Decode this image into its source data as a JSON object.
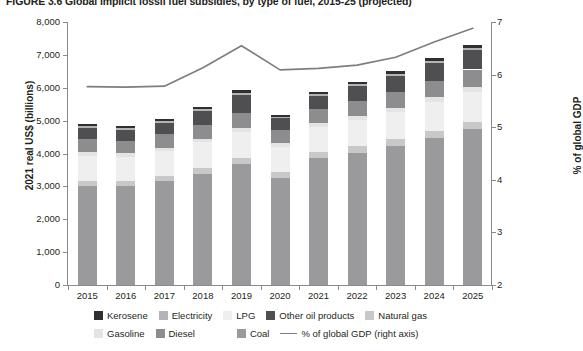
{
  "figure": {
    "title": "FIGURE 3.6  Global implicit fossil fuel subsidies, by type of fuel, 2015-25 (projected)"
  },
  "chart_data": {
    "type": "bar",
    "subtype": "stacked-bar-with-line",
    "title": "Global implicit fossil fuel subsidies, by type of fuel, 2015-25 (projected)",
    "xlabel": "",
    "ylabel": "2021 real US$ (billions)",
    "y2label": "% of global GDP",
    "ylim": [
      0,
      8000
    ],
    "y2lim": [
      2,
      7
    ],
    "yticks": [
      "0",
      "1,000",
      "2,000",
      "3,000",
      "4,000",
      "5,000",
      "6,000",
      "7,000",
      "8,000"
    ],
    "ytick_values": [
      0,
      1000,
      2000,
      3000,
      4000,
      5000,
      6000,
      7000,
      8000
    ],
    "y2ticks": [
      "2",
      "3",
      "4",
      "5",
      "6",
      "7"
    ],
    "y2tick_values": [
      2,
      3,
      4,
      5,
      6,
      7
    ],
    "grid": false,
    "legend_position": "bottom",
    "categories": [
      "2015",
      "2016",
      "2017",
      "2018",
      "2019",
      "2020",
      "2021",
      "2022",
      "2023",
      "2024",
      "2025"
    ],
    "series": [
      {
        "name": "Coal",
        "color": "#9a9a9c",
        "values": [
          3010,
          3010,
          3170,
          3390,
          3680,
          3260,
          3860,
          4030,
          4230,
          4480,
          4740
        ]
      },
      {
        "name": "Natural gas",
        "color": "#c8c8c9",
        "values": [
          160,
          150,
          160,
          175,
          180,
          170,
          175,
          190,
          200,
          215,
          225
        ]
      },
      {
        "name": "LPG",
        "color": "#efefef",
        "values": [
          760,
          740,
          740,
          770,
          790,
          760,
          770,
          800,
          830,
          870,
          900
        ]
      },
      {
        "name": "Gasoline",
        "color": "#e4e4e4",
        "values": [
          115,
          110,
          110,
          120,
          125,
          115,
          120,
          130,
          135,
          145,
          150
        ]
      },
      {
        "name": "Diesel",
        "color": "#8d8d90",
        "values": [
          390,
          380,
          400,
          420,
          450,
          400,
          440,
          460,
          480,
          510,
          540
        ]
      },
      {
        "name": "Other oil products",
        "color": "#4f4f52",
        "values": [
          340,
          330,
          350,
          420,
          540,
          360,
          390,
          430,
          470,
          520,
          580
        ]
      },
      {
        "name": "Electricity",
        "color": "#b4b4b6",
        "values": [
          55,
          50,
          55,
          60,
          70,
          55,
          60,
          65,
          70,
          75,
          80
        ]
      },
      {
        "name": "Kerosene",
        "color": "#2f2f31",
        "values": [
          60,
          60,
          65,
          70,
          85,
          60,
          65,
          75,
          80,
          85,
          95
        ]
      }
    ],
    "line_series": {
      "name": "% of global GDP (right axis)",
      "axis": "right",
      "color": "#7a7f85",
      "values": [
        5.77,
        5.76,
        5.78,
        6.13,
        6.55,
        6.09,
        6.12,
        6.18,
        6.33,
        6.62,
        6.88
      ]
    },
    "totals": [
      4890,
      4830,
      5050,
      5425,
      5920,
      5180,
      5880,
      6180,
      6495,
      6900,
      7310
    ]
  },
  "legend": {
    "row1": [
      {
        "label": "Kerosene",
        "color": "#2f2f31"
      },
      {
        "label": "Electricity",
        "color": "#b4b4b6"
      },
      {
        "label": "LPG",
        "color": "#efefef"
      },
      {
        "label": "Other oil products",
        "color": "#4f4f52"
      },
      {
        "label": "Natural gas",
        "color": "#c8c8c9"
      }
    ],
    "row2": [
      {
        "label": "Gasoline",
        "color": "#e4e4e4"
      },
      {
        "label": "Diesel",
        "color": "#8d8d90"
      },
      {
        "label": "Coal",
        "color": "#9a9a9c"
      }
    ],
    "line_entry": {
      "label": "% of global GDP (right axis)",
      "color": "#7a7f85"
    }
  }
}
